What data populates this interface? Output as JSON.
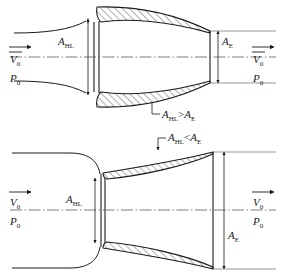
{
  "figure": {
    "background_color": "#ffffff",
    "line_color": "#1a1a1a",
    "centerline_color": "#5a5a5a"
  },
  "panels": [
    {
      "id": "upper",
      "description": "Converging nacelle inlet where highlight area exceeds exit area",
      "relation_label": "A",
      "relation_sub_left": "HL",
      "relation_operator": ">",
      "relation_right": "A",
      "relation_sub_right": "E",
      "inlet": {
        "area_symbol": "A",
        "area_subscript": "HL"
      },
      "exit": {
        "area_symbol": "A",
        "area_subscript": "E"
      },
      "freestream_left": {
        "velocity_symbol": "V",
        "velocity_subscript": "0",
        "pressure_symbol": "P",
        "pressure_subscript": "0"
      },
      "freestream_right": {
        "velocity_symbol": "V",
        "velocity_subscript": "0",
        "pressure_symbol": "P",
        "pressure_subscript": "0"
      }
    },
    {
      "id": "lower",
      "description": "Diverging nacelle inlet where highlight area is less than exit area",
      "relation_label": "A",
      "relation_sub_left": "HL",
      "relation_operator": "<",
      "relation_right": "A",
      "relation_sub_right": "E",
      "inlet": {
        "area_symbol": "A",
        "area_subscript": "HL"
      },
      "exit": {
        "area_symbol": "A",
        "area_subscript": "E"
      },
      "freestream_left": {
        "velocity_symbol": "V",
        "velocity_subscript": "0",
        "pressure_symbol": "P",
        "pressure_subscript": "0"
      },
      "freestream_right": {
        "velocity_symbol": "V",
        "velocity_subscript": "0",
        "pressure_symbol": "P",
        "pressure_subscript": "0"
      }
    }
  ]
}
